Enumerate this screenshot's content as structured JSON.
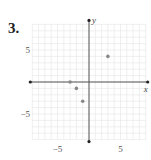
{
  "problem": {
    "number": "3."
  },
  "chart_data": {
    "type": "scatter",
    "title": "",
    "xlabel": "x",
    "ylabel": "y",
    "xlim": [
      -9,
      9
    ],
    "ylim": [
      -9,
      9
    ],
    "grid": true,
    "x_ticks_labeled": [
      {
        "value": -5,
        "label": "−5"
      },
      {
        "value": 5,
        "label": "5"
      }
    ],
    "y_ticks_labeled": [
      {
        "value": 5,
        "label": "5"
      },
      {
        "value": -5,
        "label": "−5"
      }
    ],
    "points": [
      {
        "x": 3,
        "y": 4
      },
      {
        "x": -3,
        "y": 0
      },
      {
        "x": -2,
        "y": -1
      },
      {
        "x": -1,
        "y": -3
      }
    ],
    "colors": {
      "grid": "#e4e4e4",
      "axis": "#555555",
      "point": "#888888"
    }
  }
}
